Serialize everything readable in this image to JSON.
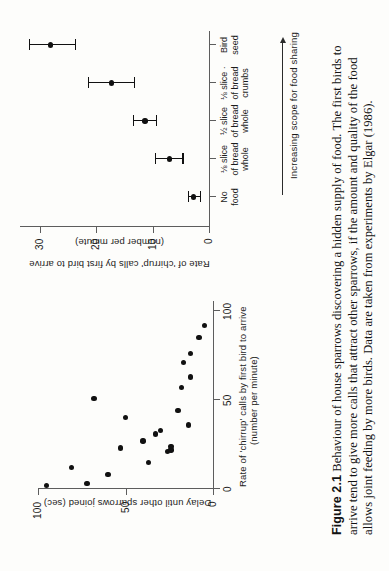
{
  "figure": {
    "number": "Figure 2.1",
    "caption": "Behaviour of house sparrows discovering a hidden supply of food. The first birds to arrive tend to give more calls that attract other sparrows, if the amount and quality of the food allows joint feeding by more birds. Data are taken from experiments by Elgar (1986).",
    "rotation_note": "page rotated 90 degrees"
  },
  "chart_data": [
    {
      "id": "scatter-panel",
      "type": "scatter",
      "title": "",
      "xlabel": "Rate of 'chirrup' calls by first bird to arrive\n(number per minute)",
      "xlabel_line1": "Rate of 'chirrup' calls by first bird to arrive",
      "xlabel_line2": "(number per minute)",
      "ylabel": "Delay until other sparrows joined (sec)",
      "xlim": [
        0,
        105
      ],
      "ylim": [
        0,
        105
      ],
      "xticks": [
        0,
        50,
        100
      ],
      "xticklabels": [
        "0",
        "50",
        "100"
      ],
      "yticks": [
        0,
        50,
        100
      ],
      "yticklabels": [
        "0",
        "50",
        "100"
      ],
      "grid": false,
      "legend": "none",
      "points": [
        {
          "x": 2,
          "y": 95
        },
        {
          "x": 3,
          "y": 72
        },
        {
          "x": 8,
          "y": 60
        },
        {
          "x": 12,
          "y": 81
        },
        {
          "x": 15,
          "y": 37
        },
        {
          "x": 21,
          "y": 26
        },
        {
          "x": 22,
          "y": 24
        },
        {
          "x": 23,
          "y": 53
        },
        {
          "x": 24,
          "y": 24
        },
        {
          "x": 27,
          "y": 40
        },
        {
          "x": 31,
          "y": 33
        },
        {
          "x": 33,
          "y": 30
        },
        {
          "x": 36,
          "y": 14
        },
        {
          "x": 40,
          "y": 50
        },
        {
          "x": 44,
          "y": 20
        },
        {
          "x": 51,
          "y": 68
        },
        {
          "x": 57,
          "y": 18
        },
        {
          "x": 63,
          "y": 13
        },
        {
          "x": 71,
          "y": 17
        },
        {
          "x": 76,
          "y": 13
        },
        {
          "x": 85,
          "y": 8
        },
        {
          "x": 92,
          "y": 5
        }
      ]
    },
    {
      "id": "errorbar-panel",
      "type": "bar",
      "title": "",
      "ylabel": "Rate of 'chirrup' calls by first bird to arrive\n(number per minute)",
      "ylabel_line1": "Rate of 'chirrup' calls by first bird to arrive",
      "ylabel_line2": "(number per minute)",
      "xlabel": "",
      "ylim": [
        0,
        33
      ],
      "yticks": [
        0,
        10,
        20,
        30
      ],
      "yticklabels": [
        "0",
        "10",
        "20",
        "30"
      ],
      "grid": false,
      "legend": "none",
      "annotation": "Increasing scope for food sharing",
      "categories": [
        "No\nfood",
        "⅛ slice\nof bread\nwhole",
        "½ slice\nof bread\nwhole",
        "⅛ slice\nof bread\ncrumbs",
        "Bird\nseed"
      ],
      "category_lines": [
        [
          "No",
          "food",
          ""
        ],
        [
          "⅛ slice",
          "of bread",
          "whole"
        ],
        [
          "½ slice",
          "of bread",
          "whole"
        ],
        [
          "⅛ slice ·",
          "of bread",
          "crumbs"
        ],
        [
          "Bird",
          "seed",
          ""
        ]
      ],
      "values": [
        2.7,
        7.0,
        11.3,
        17.3,
        28.0
      ],
      "err_low": [
        1.1,
        2.3,
        1.9,
        4.0,
        4.2
      ],
      "err_high": [
        1.1,
        2.6,
        2.2,
        4.2,
        3.9
      ]
    }
  ],
  "colors": {
    "axis": "#5d5d5d",
    "marker": "#111111",
    "text": "#1c1c1c",
    "paper": "#fdfdfb"
  }
}
